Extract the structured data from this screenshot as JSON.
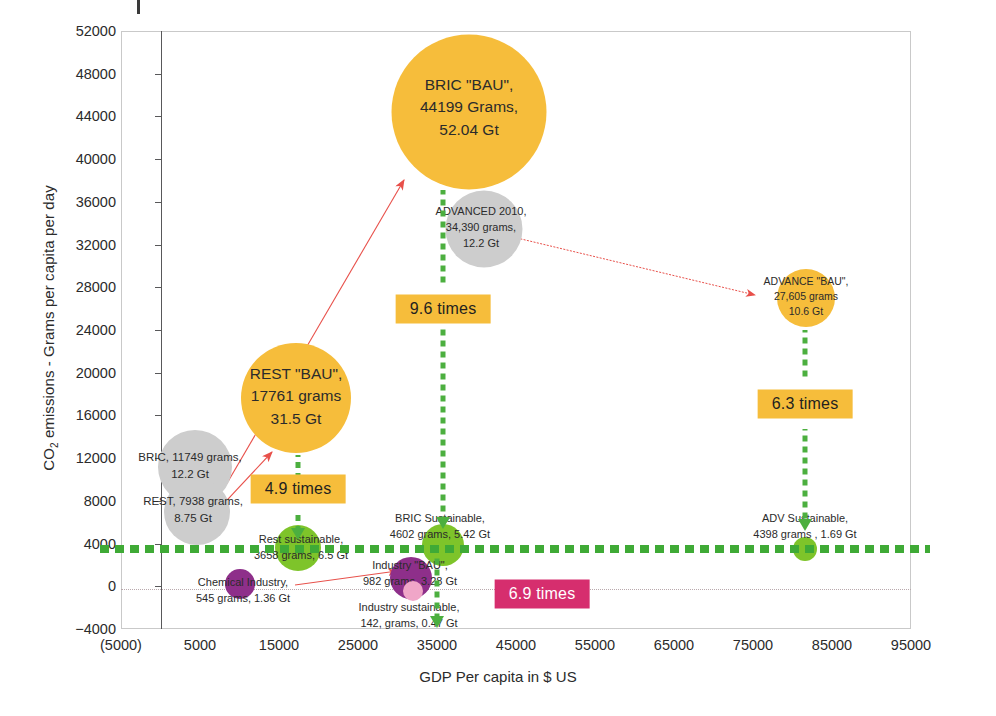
{
  "chart_data": {
    "type": "scatter",
    "title": "",
    "xlabel": "GDP Per capita in $ US",
    "ylabel": "CO2 emissions - Grams per capita per day",
    "ylabel_html": "CO<sub>2</sub> emissions - Grams per capita per day",
    "xlim": [
      -5000,
      95000
    ],
    "ylim": [
      -4000,
      52000
    ],
    "xticks": [
      "(5000)",
      "5000",
      "15000",
      "25000",
      "35000",
      "45000",
      "55000",
      "65000",
      "75000",
      "85000",
      "95000"
    ],
    "xtick_values": [
      -5000,
      5000,
      15000,
      25000,
      35000,
      45000,
      55000,
      65000,
      75000,
      85000,
      95000
    ],
    "yticks": [
      "52000",
      "48000",
      "44000",
      "40000",
      "36000",
      "32000",
      "28000",
      "24000",
      "20000",
      "16000",
      "12000",
      "8000",
      "4000",
      "0",
      "-4000"
    ],
    "ytick_values": [
      52000,
      48000,
      44000,
      40000,
      36000,
      32000,
      28000,
      24000,
      20000,
      16000,
      12000,
      8000,
      4000,
      0,
      -4000
    ],
    "grid": false,
    "legend": "none",
    "threshold_line": {
      "label": "sustainable level",
      "y": 4000,
      "color": "#3faa36",
      "style": "dotted"
    },
    "points": [
      {
        "name": "BRIC \"BAU\"",
        "x": 35000,
        "y": 44199,
        "grams": 44199,
        "gt": 52.04,
        "size_gt": 52.04,
        "color": "#f6bd3b",
        "label": "BRIC \"BAU\",\n44199 Grams,\n52.04 Gt",
        "label_inside": true
      },
      {
        "name": "ADVANCED 2010",
        "x": 38500,
        "y": 34390,
        "grams": 34390,
        "gt": 12.2,
        "size_gt": 12.2,
        "color": "#cdcdcd",
        "label": "ADVANCED 2010,\n34,390 grams,\n12.2 Gt",
        "label_inside": true
      },
      {
        "name": "ADVANCE \"BAU\"",
        "x": 79000,
        "y": 27605,
        "grams": 27605,
        "gt": 10.6,
        "size_gt": 10.6,
        "color": "#f6bd3b",
        "label": "ADVANCE \"BAU\",\n27,605 grams\n10.6 Gt",
        "label_inside": true
      },
      {
        "name": "REST \"BAU\"",
        "x": 17500,
        "y": 17761,
        "grams": 17761,
        "gt": 31.5,
        "size_gt": 31.5,
        "color": "#f6bd3b",
        "label": "REST \"BAU\",\n17761 grams\n31.5 Gt",
        "label_inside": true
      },
      {
        "name": "BRIC 2010",
        "x": 8000,
        "y": 11749,
        "grams": 11749,
        "gt": 12.2,
        "size_gt": 12.2,
        "color": "#cdcdcd",
        "label": "BRIC, 11749 grams,\n12.2 Gt",
        "label_inside": false
      },
      {
        "name": "REST 2010",
        "x": 8000,
        "y": 7938,
        "grams": 7938,
        "gt": 8.75,
        "size_gt": 8.75,
        "color": "#cdcdcd",
        "label": "REST, 7938 grams,\n8.75 Gt",
        "label_inside": false
      },
      {
        "name": "Rest sustainable",
        "x": 17500,
        "y": 3658,
        "grams": 3658,
        "gt": 6.5,
        "size_gt": 6.5,
        "color": "#7ec42a",
        "label": "Rest sustainable,\n3658 grams, 6.5 Gt",
        "label_inside": false
      },
      {
        "name": "BRIC Sustainable",
        "x": 32000,
        "y": 4602,
        "grams": 4602,
        "gt": 5.42,
        "size_gt": 5.42,
        "color": "#7ec42a",
        "label": "BRIC Sustainable,\n4602 grams, 5.42 Gt",
        "label_inside": false
      },
      {
        "name": "ADV Sustainable",
        "x": 78500,
        "y": 4398,
        "grams": 4398,
        "gt": 1.69,
        "size_gt": 1.69,
        "color": "#7ec42a",
        "label": "ADV Sustainable,\n4398 grams , 1.69 Gt",
        "label_inside": false
      },
      {
        "name": "Chemical Industry",
        "x": 11500,
        "y": 545,
        "grams": 545,
        "gt": 1.36,
        "size_gt": 1.36,
        "color": "#8e2f8a",
        "label": "Chemical Industry,\n545 grams, 1.36 Gt",
        "label_inside": false
      },
      {
        "name": "Industry \"BAU\"",
        "x": 31000,
        "y": 982,
        "grams": 982,
        "gt": 3.28,
        "size_gt": 3.28,
        "color": "#8e2f8a",
        "label": "Industry \"BAU\",\n982 grams, 3.28 Gt",
        "label_inside": false
      },
      {
        "name": "Industry sustainable",
        "x": 31000,
        "y": 142,
        "grams": 142,
        "gt": 0.47,
        "size_gt": 0.47,
        "color": "#f0a6c8",
        "label": "Industry sustainable,\n142, grams, 0.47  Gt",
        "label_inside": false
      }
    ],
    "annotations": [
      {
        "id": "ratio-bric",
        "text": "9.6 times",
        "style": "amber",
        "from": "BRIC \"BAU\"",
        "to": "BRIC Sustainable"
      },
      {
        "id": "ratio-rest",
        "text": "4.9 times",
        "style": "amber",
        "from": "REST \"BAU\"",
        "to": "Rest sustainable"
      },
      {
        "id": "ratio-advance",
        "text": "6.3 times",
        "style": "amber",
        "from": "ADVANCE \"BAU\"",
        "to": "ADV Sustainable"
      },
      {
        "id": "ratio-industry",
        "text": "6.9 times",
        "style": "magenta",
        "from": "Industry \"BAU\"",
        "to": "Industry sustainable"
      }
    ],
    "growth_arrows": [
      {
        "from": "BRIC 2010",
        "to": "BRIC \"BAU\"",
        "color": "#e8504a"
      },
      {
        "from": "REST 2010",
        "to": "REST \"BAU\"",
        "color": "#e8504a"
      },
      {
        "from": "ADVANCED 2010",
        "to": "ADVANCE \"BAU\"",
        "color": "#e8504a"
      },
      {
        "from": "Chemical Industry",
        "to": "Industry \"BAU\"",
        "color": "#e8504a"
      }
    ]
  },
  "axes": {
    "x_title": "GDP Per capita in $ US",
    "y_title_pre": "CO",
    "y_title_sub": "2",
    "y_title_post": " emissions - Grams per capita per day"
  },
  "bubbles": {
    "bric_bau": {
      "label": "BRIC \"BAU\",\n44199 Grams,\n52.04 Gt"
    },
    "advanced_2010": {
      "label": "ADVANCED 2010,\n34,390 grams,\n12.2 Gt"
    },
    "advance_bau": {
      "label": "ADVANCE \"BAU\",\n27,605 grams\n10.6 Gt"
    },
    "rest_bau": {
      "label": "REST \"BAU\",\n17761 grams\n31.5 Gt"
    },
    "bric_2010": {
      "label": "BRIC, 11749 grams,\n12.2 Gt"
    },
    "rest_2010": {
      "label": "REST, 7938 grams,\n8.75 Gt"
    },
    "rest_sust": {
      "label": "Rest sustainable,\n3658 grams, 6.5 Gt"
    },
    "bric_sust": {
      "label": "BRIC Sustainable,\n4602 grams, 5.42 Gt"
    },
    "adv_sust": {
      "label": "ADV Sustainable,\n4398 grams , 1.69 Gt"
    },
    "chem_industry": {
      "label": "Chemical Industry,\n545 grams, 1.36 Gt"
    },
    "industry_bau": {
      "label": "Industry \"BAU\",\n982 grams, 3.28 Gt"
    },
    "industry_sust": {
      "label": "Industry sustainable,\n142, grams, 0.47  Gt"
    }
  },
  "badges": {
    "bric": "9.6 times",
    "rest": "4.9 times",
    "advance": "6.3 times",
    "industry": "6.9 times"
  },
  "colors": {
    "amber": "#f6bd3b",
    "magenta": "#d62e6e",
    "green_light": "#7ec42a",
    "green_dot": "#3faa36",
    "grey_bubble": "#cdcdcd",
    "purple": "#8e2f8a",
    "pink": "#f0a6c8",
    "arrow_red": "#e8504a"
  }
}
